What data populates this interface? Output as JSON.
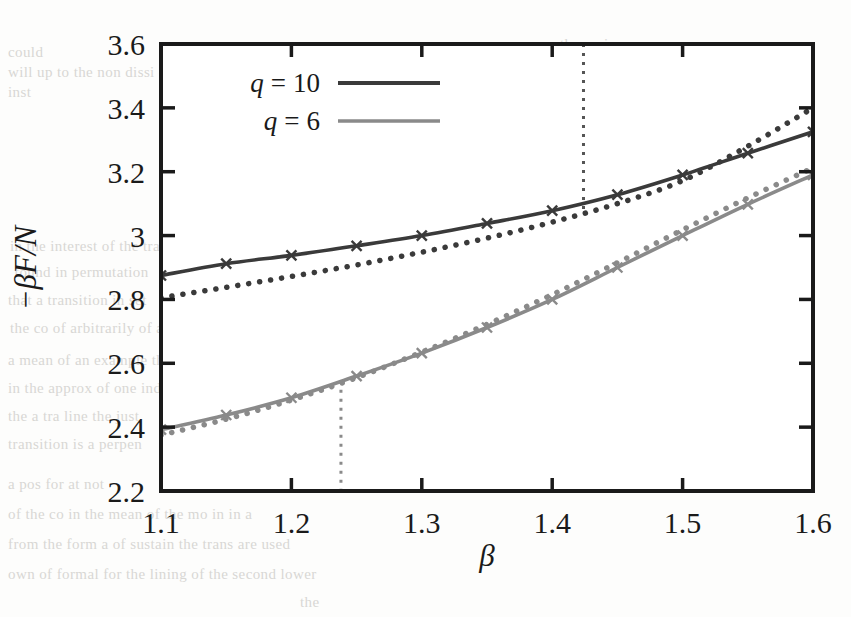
{
  "figure": {
    "title": "",
    "y_axis_label": "−βF/N",
    "x_axis_label": "β"
  },
  "legend": {
    "entries": [
      {
        "label_var": "q",
        "label_eq": "=",
        "label_val": "10",
        "color": "#3a3a3a",
        "style": "solid"
      },
      {
        "label_var": "q",
        "label_eq": "=",
        "label_val": "6",
        "color": "#8a8a8a",
        "style": "solid"
      }
    ]
  },
  "annotations": {
    "vline_q10": "1.424",
    "vline_q6": "1.238"
  },
  "chart_data": {
    "type": "line",
    "title": "",
    "xlabel": "β",
    "ylabel": "−βF/N",
    "xlim": [
      1.1,
      1.6
    ],
    "ylim": [
      2.2,
      3.6
    ],
    "xticks": [
      1.1,
      1.2,
      1.3,
      1.4,
      1.5,
      1.6
    ],
    "xticklabels": [
      "1.1",
      "1.2",
      "1.3",
      "1.4",
      "1.5",
      "1.6"
    ],
    "yticks": [
      2.2,
      2.4,
      2.6,
      2.8,
      3.0,
      3.2,
      3.4,
      3.6
    ],
    "yticklabels": [
      "2.2",
      "2.4",
      "2.6",
      "2.8",
      "3",
      "3.2",
      "3.4",
      "3.6"
    ],
    "grid": false,
    "legend_position": "upper-left",
    "vertical_lines": [
      {
        "x": 1.424,
        "style": "dotted",
        "color": "#555555",
        "label": "q = 10 transition"
      },
      {
        "x": 1.238,
        "style": "dotted",
        "color": "#8a8a8a",
        "label": "q = 6 transition"
      }
    ],
    "x": [
      1.1,
      1.15,
      1.2,
      1.25,
      1.3,
      1.35,
      1.4,
      1.45,
      1.5,
      1.55,
      1.6
    ],
    "series": [
      {
        "name": "q = 10 disordered",
        "color": "#3a3a3a",
        "style": "solid",
        "marker": "x",
        "values": [
          2.875,
          2.912,
          2.938,
          2.968,
          3.0,
          3.038,
          3.078,
          3.128,
          3.19,
          3.258,
          3.325
        ]
      },
      {
        "name": "q = 10 ordered",
        "color": "#3a3a3a",
        "style": "dotted",
        "marker": "none",
        "values": [
          2.805,
          2.838,
          2.872,
          2.908,
          2.948,
          2.992,
          3.042,
          3.1,
          3.172,
          3.28,
          3.4
        ]
      },
      {
        "name": "q = 6 disordered",
        "color": "#8a8a8a",
        "style": "solid",
        "marker": "x",
        "values": [
          2.392,
          2.438,
          2.492,
          2.56,
          2.632,
          2.712,
          2.8,
          2.9,
          3.0,
          3.098,
          3.19
        ]
      },
      {
        "name": "q = 6 ordered",
        "color": "#8a8a8a",
        "style": "dotted",
        "marker": "none",
        "values": [
          2.375,
          2.425,
          2.485,
          2.555,
          2.635,
          2.722,
          2.815,
          2.915,
          3.018,
          3.118,
          3.212
        ]
      }
    ]
  },
  "bleedthrough": [
    {
      "t": "could",
      "x": 8,
      "y": 44
    },
    {
      "t": "will up to the non dissi on the",
      "x": 8,
      "y": 64
    },
    {
      "t": "inst",
      "x": 8,
      "y": 84
    },
    {
      "t": "the variance",
      "x": 560,
      "y": 36
    },
    {
      "t": "a the spin are for use",
      "x": 612,
      "y": 62
    },
    {
      "t": "that it that the side",
      "x": 630,
      "y": 88
    },
    {
      "t": "for anti-ferro",
      "x": 648,
      "y": 114
    },
    {
      "t": "quantum",
      "x": 520,
      "y": 202
    },
    {
      "t": "in the interest of the transition",
      "x": 10,
      "y": 238
    },
    {
      "t": "found in permutation",
      "x": 14,
      "y": 264
    },
    {
      "t": "that a transition in set",
      "x": 8,
      "y": 292
    },
    {
      "t": "the co of arbitrarily of a study of a and that",
      "x": 10,
      "y": 320
    },
    {
      "t": "a mean of an example the structure spot",
      "x": 8,
      "y": 352
    },
    {
      "t": "in the approx of one indicates a order point switch in an",
      "x": 8,
      "y": 380
    },
    {
      "t": "the a tra line the just",
      "x": 8,
      "y": 408
    },
    {
      "t": "transition is a perpen",
      "x": 8,
      "y": 436
    },
    {
      "t": "a pos for at not",
      "x": 8,
      "y": 476
    },
    {
      "t": "of the co in the mean of the mo in in a",
      "x": 8,
      "y": 506
    },
    {
      "t": "from the form a of sustain the trans are used",
      "x": 8,
      "y": 536
    },
    {
      "t": "own of formal for the lining of the second lower",
      "x": 8,
      "y": 566
    },
    {
      "t": "the",
      "x": 300,
      "y": 594
    }
  ]
}
